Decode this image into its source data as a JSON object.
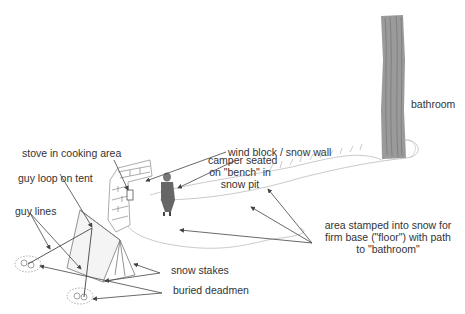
{
  "diagram": {
    "labels": {
      "wind_block": "wind block / snow wall",
      "stove": "stove in cooking area",
      "camper_line1": "camper seated",
      "camper_line2": "on \"bench\" in",
      "camper_line3": "snow pit",
      "guy_loop": "guy loop on tent",
      "guy_lines": "guy lines",
      "snow_stakes": "snow stakes",
      "buried_deadmen": "buried deadmen",
      "area_line1": "area stamped into snow for",
      "area_line2": "firm base (\"floor\") with path",
      "area_line3": "to \"bathroom\"",
      "bathroom": "bathroom"
    },
    "colors": {
      "tree": "#9a9a9a",
      "tree_bark": "#6e6e6e",
      "line": "#444444",
      "text": "#333333",
      "snow_outline": "#bdbdbd"
    }
  }
}
